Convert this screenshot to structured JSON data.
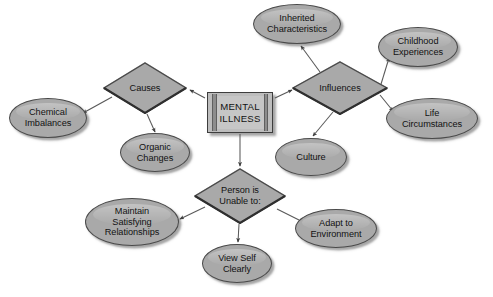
{
  "diagram": {
    "type": "concept-map",
    "center": {
      "id": "mental-illness",
      "shape": "rectangle",
      "label": "MENTAL\nILLNESS",
      "x": 240,
      "y": 112,
      "w": 66,
      "h": 41
    },
    "diamonds": [
      {
        "id": "causes",
        "shape": "diamond",
        "label": "Causes",
        "x": 145,
        "y": 88,
        "w": 84,
        "h": 52
      },
      {
        "id": "influences",
        "shape": "diamond",
        "label": "Influences",
        "x": 340,
        "y": 88,
        "w": 96,
        "h": 54
      },
      {
        "id": "unable-to",
        "shape": "diamond",
        "label": "Person is\nUnable to:",
        "x": 240,
        "y": 196,
        "w": 92,
        "h": 56
      }
    ],
    "ellipses": [
      {
        "id": "chemical-imbalances",
        "shape": "ellipse",
        "label": "Chemical\nImbalances",
        "x": 48,
        "y": 118,
        "w": 78,
        "h": 40
      },
      {
        "id": "organic-changes",
        "shape": "ellipse",
        "label": "Organic\nChanges",
        "x": 155,
        "y": 153,
        "w": 70,
        "h": 39
      },
      {
        "id": "inherited-characteristics",
        "shape": "ellipse",
        "label": "Inherited\nCharacteristics",
        "x": 297,
        "y": 24,
        "w": 88,
        "h": 40
      },
      {
        "id": "childhood-experiences",
        "shape": "ellipse",
        "label": "Childhood\nExperiences",
        "x": 418,
        "y": 47,
        "w": 80,
        "h": 40
      },
      {
        "id": "life-circumstances",
        "shape": "ellipse",
        "label": "Life\nCircumstances",
        "x": 432,
        "y": 118,
        "w": 92,
        "h": 41
      },
      {
        "id": "culture",
        "shape": "ellipse",
        "label": "Culture",
        "x": 311,
        "y": 157,
        "w": 72,
        "h": 38
      },
      {
        "id": "maintain-relationships",
        "shape": "ellipse",
        "label": "Maintain\nSatisfying\nRelationships",
        "x": 132,
        "y": 222,
        "w": 94,
        "h": 48
      },
      {
        "id": "view-self-clearly",
        "shape": "ellipse",
        "label": "View Self\nClearly",
        "x": 237,
        "y": 263,
        "w": 70,
        "h": 39
      },
      {
        "id": "adapt-to-environment",
        "shape": "ellipse",
        "label": "Adapt to\nEnvironment",
        "x": 336,
        "y": 228,
        "w": 82,
        "h": 39
      }
    ],
    "edges": [
      {
        "id": "mi-to-causes",
        "from": "mental-illness",
        "to": "causes",
        "arrow": "to"
      },
      {
        "id": "mi-to-influences",
        "from": "mental-illness",
        "to": "influences",
        "arrow": "to"
      },
      {
        "id": "mi-to-unable",
        "from": "mental-illness",
        "to": "unable-to",
        "arrow": "to"
      },
      {
        "id": "causes-chemical",
        "from": "causes",
        "to": "chemical-imbalances",
        "arrow": "to"
      },
      {
        "id": "causes-organic",
        "from": "causes",
        "to": "organic-changes",
        "arrow": "to"
      },
      {
        "id": "infl-inherited",
        "from": "influences",
        "to": "inherited-characteristics",
        "arrow": "to"
      },
      {
        "id": "infl-childhood",
        "from": "influences",
        "to": "childhood-experiences",
        "arrow": "to"
      },
      {
        "id": "infl-life",
        "from": "influences",
        "to": "life-circumstances",
        "arrow": "to"
      },
      {
        "id": "infl-culture",
        "from": "influences",
        "to": "culture",
        "arrow": "to"
      },
      {
        "id": "unable-maintain",
        "from": "unable-to",
        "to": "maintain-relationships",
        "arrow": "to"
      },
      {
        "id": "unable-viewself",
        "from": "unable-to",
        "to": "view-self-clearly",
        "arrow": "to"
      },
      {
        "id": "unable-adapt",
        "from": "unable-to",
        "to": "adapt-to-environment",
        "arrow": "to"
      }
    ],
    "colors": {
      "shape_fill": "#a9a9a9",
      "box_fill": "#bdbdbd",
      "outline": "#4a4a4a",
      "text": "#121212",
      "connector": "#555555",
      "background": "#ffffff"
    }
  }
}
